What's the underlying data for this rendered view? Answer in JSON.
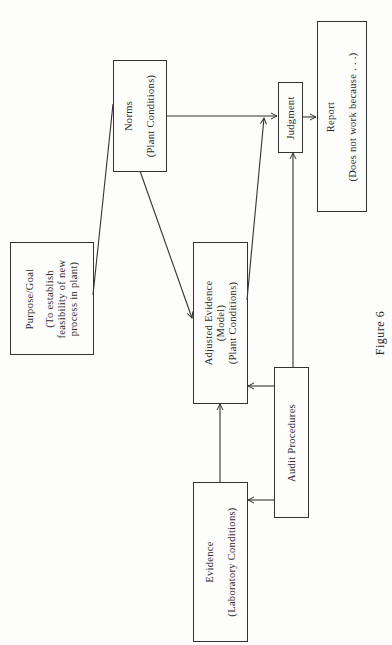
{
  "figure": {
    "caption": "Figure 6"
  },
  "nodes": {
    "norms": {
      "title": "Norms",
      "subtitle": "(Plant Conditions)"
    },
    "judgment": {
      "title": "Judgment"
    },
    "report": {
      "title": "Report",
      "subtitle": "(Does not work because . . .)"
    },
    "purpose": {
      "title": "Purpose/Goal",
      "line1": "(To establish",
      "line2": "feasibility of new",
      "line3": "process in plant)"
    },
    "adjusted_evidence": {
      "title": "Adjusted Evidence",
      "line2": "(Model)",
      "line3": "(Plant Conditions)"
    },
    "audit": {
      "title": "Audit Procedures"
    },
    "evidence": {
      "title": "Evidence",
      "subtitle": "(Laboratory Conditions)"
    }
  },
  "edges": [
    {
      "from": "Purpose/Goal",
      "to": "Norms",
      "arrow": false
    },
    {
      "from": "Norms",
      "to": "Adjusted Evidence",
      "arrow": true
    },
    {
      "from": "Norms",
      "to": "Judgment",
      "arrow": true
    },
    {
      "from": "Adjusted Evidence",
      "to": "Judgment",
      "arrow": true
    },
    {
      "from": "Evidence",
      "to": "Adjusted Evidence",
      "arrow": true
    },
    {
      "from": "Audit Procedures",
      "to": "Evidence",
      "arrow": true
    },
    {
      "from": "Audit Procedures",
      "to": "Adjusted Evidence",
      "arrow": true
    },
    {
      "from": "Audit Procedures",
      "to": "Judgment",
      "arrow": true
    },
    {
      "from": "Judgment",
      "to": "Report",
      "arrow": true
    }
  ]
}
